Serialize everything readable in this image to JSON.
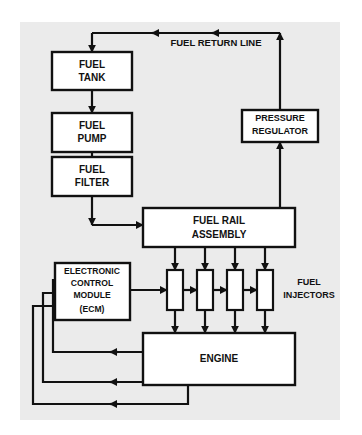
{
  "figure": {
    "kind": "block-diagram",
    "frame_fill": "#ebebeb",
    "page_background": "#ffffff",
    "line_color": "#111111",
    "box_fill": "#ffffff",
    "text_color": "#111111"
  },
  "boxes": {
    "fuel_tank": {
      "line1": "FUEL",
      "line2": "TANK"
    },
    "fuel_pump": {
      "line1": "FUEL",
      "line2": "PUMP"
    },
    "fuel_filter": {
      "line1": "FUEL",
      "line2": "FILTER"
    },
    "pressure_regulator": {
      "line1": "PRESSURE",
      "line2": "REGULATOR"
    },
    "fuel_rail_assembly": {
      "line1": "FUEL RAIL",
      "line2": "ASSEMBLY"
    },
    "electronic_control_module": {
      "line1": "ELECTRONIC",
      "line2": "CONTROL",
      "line3": "MODULE",
      "line4": "(ECM)"
    },
    "engine": {
      "line1": "ENGINE"
    },
    "injector_1": {
      "label": ""
    },
    "injector_2": {
      "label": ""
    },
    "injector_3": {
      "label": ""
    },
    "injector_4": {
      "label": ""
    }
  },
  "labels": {
    "fuel_return_line": "FUEL RETURN LINE",
    "fuel_injectors_line1": "FUEL",
    "fuel_injectors_line2": "INJECTORS"
  }
}
